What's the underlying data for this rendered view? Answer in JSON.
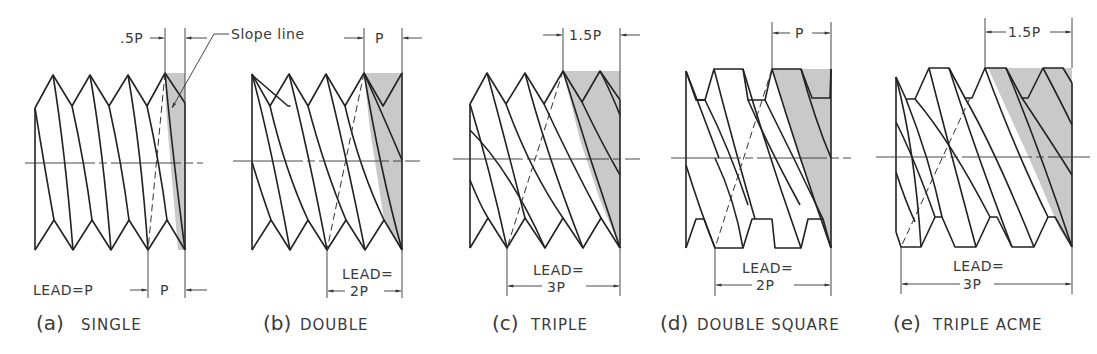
{
  "diagram": {
    "shade_color": "#c9c9c9",
    "line_color": "#222222",
    "figures": [
      {
        "id": "a",
        "caption_letter": "(a)",
        "caption_word": "SINGLE",
        "top_dim": ".5P",
        "callout": "Slope line",
        "lead_label": "LEAD=P",
        "bottom_dim": "P"
      },
      {
        "id": "b",
        "caption_letter": "(b)",
        "caption_word": "DOUBLE",
        "top_dim": "P",
        "lead_label_line1": "LEAD=",
        "lead_label_line2": "2P"
      },
      {
        "id": "c",
        "caption_letter": "(c)",
        "caption_word": "TRIPLE",
        "top_dim": "1.5P",
        "lead_label_line1": "LEAD=",
        "lead_label_line2": "3P"
      },
      {
        "id": "d",
        "caption_letter": "(d)",
        "caption_word": "DOUBLE SQUARE",
        "top_dim": "P",
        "lead_label_line1": "LEAD=",
        "lead_label_line2": "2P"
      },
      {
        "id": "e",
        "caption_letter": "(e)",
        "caption_word": "TRIPLE ACME",
        "top_dim": "1.5P",
        "lead_label_line1": "LEAD=",
        "lead_label_line2": "3P"
      }
    ]
  }
}
